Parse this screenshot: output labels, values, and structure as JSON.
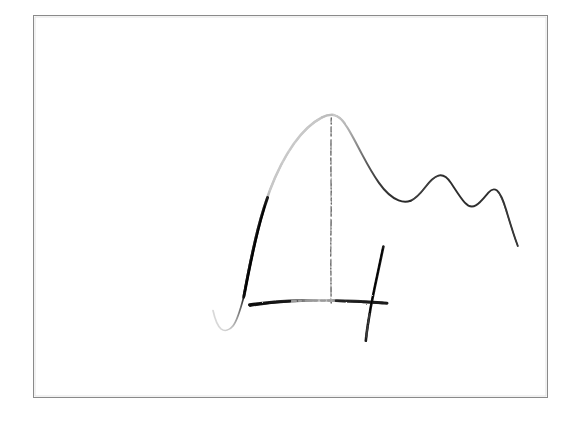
{
  "document": {
    "kind": "scanned-hand-drawn-sketch",
    "title": "",
    "caption": "",
    "background_color": "#ffffff",
    "width": 578,
    "height": 423
  },
  "frame": {
    "name": "page-border",
    "x": 33,
    "y": 15,
    "width": 515,
    "height": 383,
    "stroke_color": "#8a8a8a",
    "stroke_width": 1
  },
  "ink": {
    "dark_color": "#1a1a1a",
    "mid_color": "#555555",
    "faint_color": "#b4b4b4",
    "very_faint_color": "#d2d2d2"
  },
  "chart_data": {
    "type": "line",
    "title": "",
    "subtitle": "",
    "xlabel": "",
    "ylabel": "",
    "grid": false,
    "legend": null,
    "axis_ticks_visible": false,
    "tick_labels_x": [],
    "tick_labels_y": [],
    "xlim": [
      200,
      530
    ],
    "ylim": [
      350,
      100
    ],
    "series": [
      {
        "name": "hand-drawn-curve",
        "points": [
          [
            213,
            311
          ],
          [
            216,
            320
          ],
          [
            220,
            327
          ],
          [
            226,
            330
          ],
          [
            233,
            326
          ],
          [
            239,
            314
          ],
          [
            244,
            297
          ],
          [
            249,
            274
          ],
          [
            254,
            252
          ],
          [
            260,
            230
          ],
          [
            266,
            210
          ],
          [
            273,
            192
          ],
          [
            281,
            174
          ],
          [
            290,
            157
          ],
          [
            299,
            142
          ],
          [
            309,
            130
          ],
          [
            319,
            121
          ],
          [
            328,
            116
          ],
          [
            334,
            115
          ],
          [
            341,
            118
          ],
          [
            348,
            126
          ],
          [
            355,
            137
          ],
          [
            362,
            149
          ],
          [
            369,
            160
          ],
          [
            376,
            170
          ],
          [
            384,
            181
          ],
          [
            392,
            191
          ],
          [
            400,
            198
          ],
          [
            408,
            201
          ],
          [
            414,
            200
          ],
          [
            421,
            194
          ],
          [
            428,
            185
          ],
          [
            435,
            177
          ],
          [
            441,
            175
          ],
          [
            448,
            180
          ],
          [
            455,
            190
          ],
          [
            462,
            200
          ],
          [
            469,
            206
          ],
          [
            476,
            205
          ],
          [
            483,
            197
          ],
          [
            490,
            190
          ],
          [
            496,
            190
          ],
          [
            502,
            199
          ],
          [
            508,
            216
          ],
          [
            513,
            232
          ],
          [
            518,
            246
          ]
        ]
      }
    ],
    "peak": {
      "x": 332,
      "y": 115,
      "label": ""
    },
    "ripples": [
      {
        "type": "trough",
        "x": 412,
        "y": 200
      },
      {
        "type": "crest",
        "x": 438,
        "y": 176
      },
      {
        "type": "trough",
        "x": 470,
        "y": 206
      },
      {
        "type": "crest",
        "x": 493,
        "y": 189
      }
    ]
  },
  "annotations": {
    "baseline_stroke": {
      "name": "horizontal-axis-stroke",
      "x_start": 249,
      "x_end": 387,
      "y": 302,
      "note": "hand-drawn horizontal rule, ink fades toward the middle"
    },
    "vertical_tick_stroke": {
      "name": "vertical-axis-stroke",
      "x_top": 383,
      "y_top": 246,
      "x_bottom": 366,
      "y_bottom": 341,
      "note": "slanted hand-drawn vertical stroke crossing the baseline"
    },
    "peak_dashed_line": {
      "name": "peak-marker-dashed-line",
      "x": 331,
      "y_top": 118,
      "y_bottom": 303,
      "note": "faint broken vertical line dropped from the apex to the baseline"
    }
  }
}
